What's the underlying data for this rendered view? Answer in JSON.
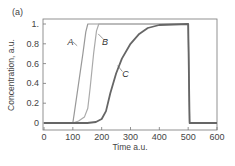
{
  "chart_data": {
    "type": "line",
    "panel_label": "(a)",
    "title": "",
    "xlabel": "Time a.u.",
    "ylabel": "Concentration, a.u.",
    "xlim": [
      0,
      600
    ],
    "ylim": [
      0,
      1
    ],
    "x_ticks": [
      0,
      100,
      200,
      300,
      400,
      500,
      600
    ],
    "x_tick_labels": [
      "0",
      "100",
      "200",
      "300",
      "400",
      "500",
      "600"
    ],
    "y_ticks": [
      0,
      0.2,
      0.4,
      0.6,
      0.8,
      1.0
    ],
    "y_tick_labels": [
      "0",
      "0.2",
      "0.4",
      "0.6",
      "0.8",
      "1."
    ],
    "grid": false,
    "series": [
      {
        "name": "A",
        "color": "#999999",
        "points": [
          [
            0,
            0
          ],
          [
            100,
            0
          ],
          [
            105,
            0.1
          ],
          [
            120,
            0.4
          ],
          [
            135,
            0.7
          ],
          [
            145,
            0.92
          ],
          [
            152,
            1.0
          ],
          [
            500,
            1.0
          ],
          [
            505,
            0.0
          ],
          [
            600,
            0.0
          ]
        ]
      },
      {
        "name": "B",
        "color": "#aaaaaa",
        "points": [
          [
            0,
            0
          ],
          [
            100,
            0
          ],
          [
            120,
            0.02
          ],
          [
            140,
            0.06
          ],
          [
            152,
            0.15
          ],
          [
            160,
            0.35
          ],
          [
            172,
            0.7
          ],
          [
            182,
            0.93
          ],
          [
            190,
            1.0
          ],
          [
            500,
            1.0
          ],
          [
            505,
            0.0
          ],
          [
            600,
            0.0
          ]
        ]
      },
      {
        "name": "C",
        "color": "#666666",
        "points": [
          [
            0,
            0
          ],
          [
            150,
            0
          ],
          [
            180,
            0.01
          ],
          [
            200,
            0.04
          ],
          [
            215,
            0.12
          ],
          [
            230,
            0.3
          ],
          [
            250,
            0.5
          ],
          [
            270,
            0.65
          ],
          [
            300,
            0.8
          ],
          [
            330,
            0.9
          ],
          [
            360,
            0.96
          ],
          [
            400,
            0.99
          ],
          [
            500,
            1.0
          ],
          [
            505,
            0.0
          ],
          [
            600,
            0.0
          ]
        ]
      }
    ],
    "annotations": [
      {
        "text": "A",
        "x": 95,
        "y": 0.82,
        "series": "A"
      },
      {
        "text": "B",
        "x": 215,
        "y": 0.82,
        "series": "B"
      },
      {
        "text": "C",
        "x": 285,
        "y": 0.5,
        "series": "C"
      }
    ]
  }
}
